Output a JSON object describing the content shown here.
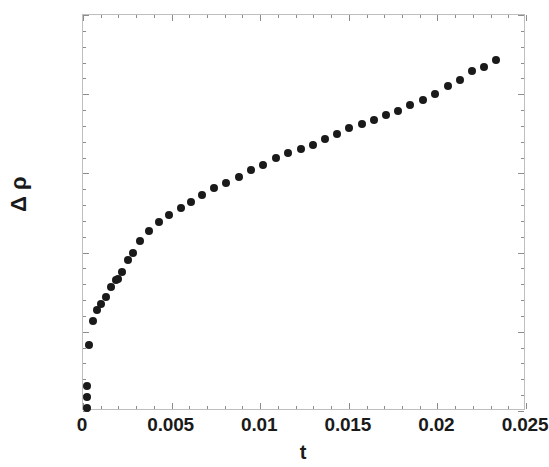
{
  "chart_data": {
    "type": "scatter",
    "title": "",
    "subtitle": "",
    "xlabel": "t",
    "ylabel": "Δ ρ",
    "xlim": [
      0,
      0.025
    ],
    "ylim": [
      0,
      0.01
    ],
    "xticks": [
      0,
      0.005,
      0.01,
      0.015,
      0.02,
      0.025
    ],
    "xtick_labels": [
      "0",
      "0.005",
      "0.01",
      "0.015",
      "0.02",
      "0.025"
    ],
    "yticks": [
      0,
      0.002,
      0.004,
      0.006,
      0.008,
      0.01
    ],
    "ytick_labels": [
      "0",
      "0.002",
      "0.004",
      "0.006",
      "0.008",
      "0.01"
    ],
    "x_minor_tick_step": 0.001,
    "y_minor_tick_step": 0.0004,
    "grid": false,
    "legend": null,
    "marker": "filled-circle",
    "marker_color": "#1a1a1a",
    "marker_size_px": 8,
    "frame": true,
    "points": [
      {
        "x": 0.00022,
        "y": 8e-05
      },
      {
        "x": 0.00022,
        "y": 0.00035
      },
      {
        "x": 0.00022,
        "y": 0.00063
      },
      {
        "x": 0.00034,
        "y": 0.00167
      },
      {
        "x": 0.00058,
        "y": 0.00228
      },
      {
        "x": 0.0008,
        "y": 0.00254
      },
      {
        "x": 0.00103,
        "y": 0.0027
      },
      {
        "x": 0.0013,
        "y": 0.00288
      },
      {
        "x": 0.0016,
        "y": 0.00312
      },
      {
        "x": 0.00186,
        "y": 0.0033
      },
      {
        "x": 0.00196,
        "y": 0.00334
      },
      {
        "x": 0.00222,
        "y": 0.00352
      },
      {
        "x": 0.00252,
        "y": 0.00382
      },
      {
        "x": 0.00282,
        "y": 0.004
      },
      {
        "x": 0.0032,
        "y": 0.0043
      },
      {
        "x": 0.00372,
        "y": 0.00455
      },
      {
        "x": 0.00428,
        "y": 0.00478
      },
      {
        "x": 0.00488,
        "y": 0.00496
      },
      {
        "x": 0.00552,
        "y": 0.00512
      },
      {
        "x": 0.0061,
        "y": 0.00528
      },
      {
        "x": 0.00672,
        "y": 0.00545
      },
      {
        "x": 0.00742,
        "y": 0.00563
      },
      {
        "x": 0.00808,
        "y": 0.00576
      },
      {
        "x": 0.0088,
        "y": 0.0059
      },
      {
        "x": 0.00948,
        "y": 0.00608
      },
      {
        "x": 0.01018,
        "y": 0.0062
      },
      {
        "x": 0.01088,
        "y": 0.00638
      },
      {
        "x": 0.01158,
        "y": 0.00652
      },
      {
        "x": 0.01228,
        "y": 0.00662
      },
      {
        "x": 0.01296,
        "y": 0.00672
      },
      {
        "x": 0.01364,
        "y": 0.00686
      },
      {
        "x": 0.01432,
        "y": 0.007
      },
      {
        "x": 0.01502,
        "y": 0.00714
      },
      {
        "x": 0.01572,
        "y": 0.00724
      },
      {
        "x": 0.0164,
        "y": 0.00736
      },
      {
        "x": 0.0171,
        "y": 0.00748
      },
      {
        "x": 0.0178,
        "y": 0.00758
      },
      {
        "x": 0.01848,
        "y": 0.00772
      },
      {
        "x": 0.01918,
        "y": 0.00786
      },
      {
        "x": 0.01988,
        "y": 0.008
      },
      {
        "x": 0.02058,
        "y": 0.0082
      },
      {
        "x": 0.02126,
        "y": 0.00836
      },
      {
        "x": 0.02196,
        "y": 0.00858
      },
      {
        "x": 0.02262,
        "y": 0.00868
      },
      {
        "x": 0.0233,
        "y": 0.00886
      }
    ]
  }
}
